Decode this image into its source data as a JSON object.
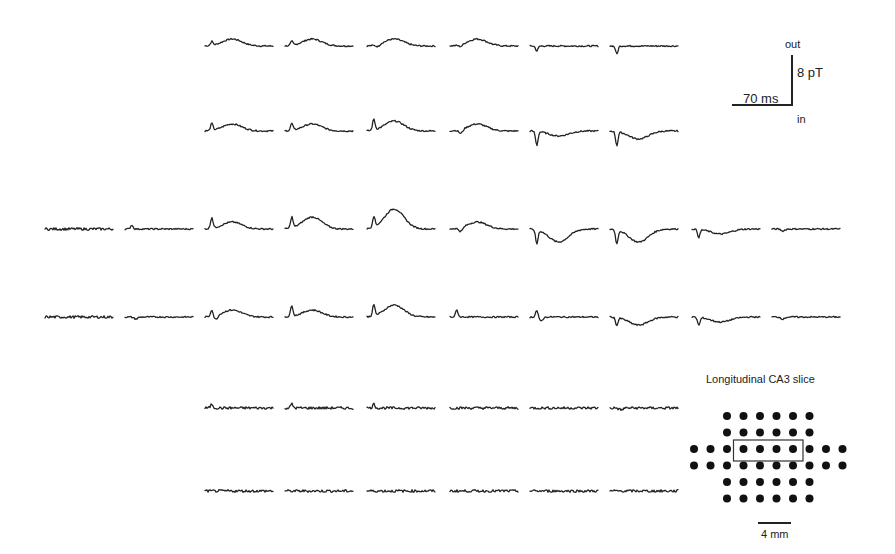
{
  "figure": {
    "type": "MEG sensor-array trace grid",
    "scale_bar": {
      "time_label": "70 ms",
      "amplitude_label": "8 pT",
      "top_label": "out",
      "bottom_label": "in"
    },
    "inset": {
      "title": "Longitudinal CA3 slice",
      "scale_label": "4 mm",
      "rows": [
        6,
        6,
        10,
        10,
        6,
        6
      ],
      "highlight": {
        "row": 2,
        "col_start": 3,
        "col_end": 6
      }
    }
  },
  "chart_data": {
    "type": "line",
    "title": "",
    "xlabel": "",
    "ylabel": "",
    "scale_bar": {
      "x": "70 ms",
      "y": "8 pT",
      "y_positive": "out",
      "y_negative": "in"
    },
    "grid": false,
    "layout": "sensor array: rows of 6, 6, 10, 10, 6, 6 traces",
    "rows": [
      {
        "row": 1,
        "columns": [
          3,
          4,
          5,
          6,
          7,
          8
        ],
        "shapes": [
          "small peak + slow positive hump",
          "small peak + slow positive hump",
          "small dip + positive hump",
          "small dip + positive hump",
          "small negative spike, flat",
          "negative spike, flat rise"
        ]
      },
      {
        "row": 2,
        "columns": [
          3,
          4,
          5,
          6,
          7,
          8
        ],
        "shapes": [
          "peak + positive hump",
          "peak + positive hump",
          "sharp peak + larger hump",
          "dip + positive hump",
          "sharp negative spike + shallow trough",
          "sharp negative spike + trough"
        ]
      },
      {
        "row": 3,
        "columns": [
          1,
          2,
          3,
          4,
          5,
          6,
          7,
          8,
          9,
          10
        ],
        "shapes": [
          "flat noise",
          "small peak, flat",
          "sharp peak + hump",
          "sharp peak + large hump",
          "sharp peak + largest hump",
          "dip + positive hump",
          "sharp negative spike + deep trough",
          "sharp negative spike + deep trough",
          "negative spike + shallow trough",
          "small dip, flat"
        ]
      },
      {
        "row": 4,
        "columns": [
          1,
          2,
          3,
          4,
          5,
          6,
          7,
          8,
          9,
          10
        ],
        "shapes": [
          "flat noise",
          "small dip, flat",
          "peak + dip + hump",
          "sharp peak + hump",
          "sharp peak + large hump",
          "peak + slow decline",
          "peak + dip",
          "negative spike + trough",
          "negative spike + shallow trough",
          "small dip, flat"
        ]
      },
      {
        "row": 5,
        "columns": [
          3,
          4,
          5,
          6,
          7,
          8
        ],
        "shapes": [
          "small peak, noisy",
          "small peak, noisy",
          "small peak, noisy",
          "noise",
          "noise",
          "small dip, noisy"
        ]
      },
      {
        "row": 6,
        "columns": [
          3,
          4,
          5,
          6,
          7,
          8
        ],
        "shapes": [
          "noise",
          "noise",
          "noise",
          "noise",
          "noise",
          "noise"
        ]
      }
    ]
  }
}
